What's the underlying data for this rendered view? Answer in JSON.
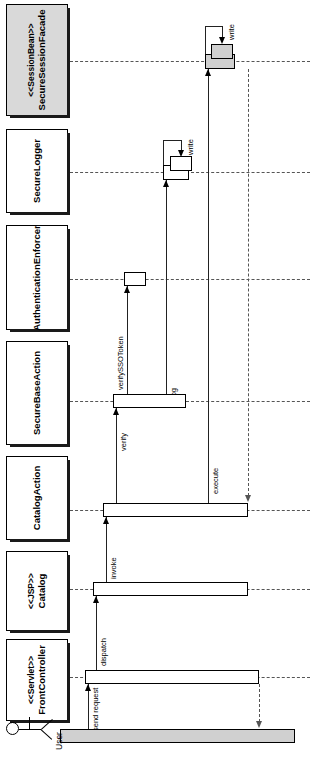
{
  "diagram": {
    "kind": "uml-sequence-diagram",
    "orientation": "rotated-90-counterclockwise",
    "actor": {
      "name": "User",
      "icon": "actor-stick-figure"
    },
    "participants": [
      {
        "id": "securesessionfacade",
        "stereotype": "<<SessionBean>>",
        "name": "SecureSessionFacade",
        "shaded": true
      },
      {
        "id": "securelogger",
        "stereotype": "",
        "name": "SecureLogger",
        "shaded": false
      },
      {
        "id": "authenticationenforcer",
        "stereotype": "",
        "name": "AuthenticationEnforcer",
        "shaded": false
      },
      {
        "id": "securebaseaction",
        "stereotype": "",
        "name": "SecureBaseAction",
        "shaded": false
      },
      {
        "id": "catalogaction",
        "stereotype": "",
        "name": "CatalogAction",
        "shaded": false
      },
      {
        "id": "catalog",
        "stereotype": "<<JSP>>",
        "name": "Catalog",
        "shaded": false
      },
      {
        "id": "frontcontroller",
        "stereotype": "<<Servlet>>",
        "name": "FrontController",
        "shaded": false
      }
    ],
    "messages": [
      {
        "id": "m1",
        "label": "send request",
        "from": "User",
        "to": "FrontController",
        "type": "call"
      },
      {
        "id": "m2",
        "label": "dispatch",
        "from": "FrontController",
        "to": "Catalog",
        "type": "call"
      },
      {
        "id": "m3",
        "label": "invoke",
        "from": "Catalog",
        "to": "CatalogAction",
        "type": "call"
      },
      {
        "id": "m4",
        "label": "verify",
        "from": "CatalogAction",
        "to": "SecureBaseAction",
        "type": "call"
      },
      {
        "id": "m5",
        "label": "verifySSOToken",
        "from": "SecureBaseAction",
        "to": "AuthenticationEnforcer",
        "type": "call"
      },
      {
        "id": "m6",
        "label": "log",
        "from": "SecureBaseAction",
        "to": "SecureLogger",
        "type": "call"
      },
      {
        "id": "m7",
        "label": "write",
        "from": "SecureLogger",
        "to": "SecureLogger",
        "type": "self-call"
      },
      {
        "id": "m8",
        "label": "execute",
        "from": "CatalogAction",
        "to": "SecureSessionFacade",
        "type": "call"
      },
      {
        "id": "m9",
        "label": "write",
        "from": "SecureSessionFacade",
        "to": "SecureSessionFacade",
        "type": "self-call"
      },
      {
        "id": "m10",
        "label": "",
        "from": "SecureSessionFacade",
        "to": "CatalogAction",
        "type": "return"
      },
      {
        "id": "m11",
        "label": "",
        "from": "FrontController",
        "to": "User",
        "type": "return"
      }
    ],
    "colors": {
      "shaded_fill": "#d9d9d9",
      "line": "#222222",
      "lifeline": "#555555",
      "background": "#ffffff"
    }
  }
}
